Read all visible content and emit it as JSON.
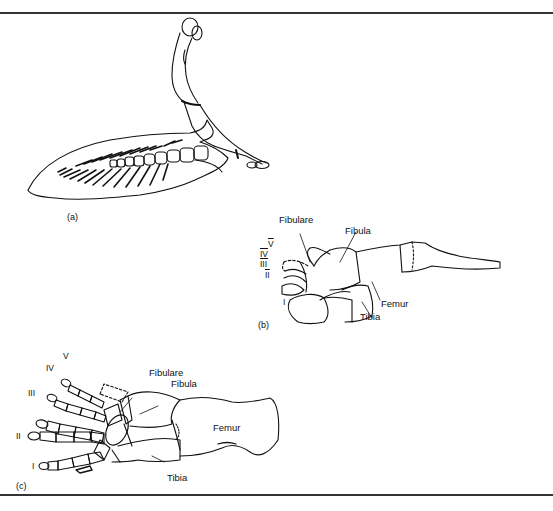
{
  "figure": {
    "panels": [
      {
        "id": "a",
        "caption": "(a)",
        "labels": []
      },
      {
        "id": "b",
        "caption": "(b)",
        "labels": {
          "fibulare": "Fibulare",
          "fibula": "Fibula",
          "femur": "Femur",
          "tibia": "Tibia",
          "digits": [
            "V",
            "IV",
            "III",
            "II",
            "I"
          ]
        }
      },
      {
        "id": "c",
        "caption": "(c)",
        "labels": {
          "fibulare": "Fibulare",
          "fibula": "Fibula",
          "femur": "Femur",
          "tibia": "Tibia",
          "digits": [
            "V",
            "IV",
            "III",
            "II",
            "I"
          ]
        }
      }
    ],
    "line_color": "#111111",
    "rule_color": "#333333",
    "background": "#ffffff"
  }
}
